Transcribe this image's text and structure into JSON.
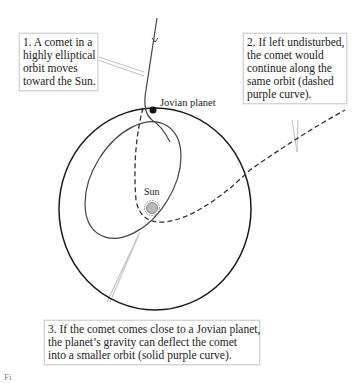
{
  "callouts": {
    "c1": {
      "lines": [
        "1. A comet in a",
        "highly elliptical",
        "orbit moves",
        "toward the Sun."
      ]
    },
    "c2": {
      "lines": [
        "2. If left undisturbed,",
        "the comet would",
        "continue along the",
        "same orbit (dashed",
        "purple curve)."
      ]
    },
    "c3": {
      "lines": [
        "3. If the comet comes close to a Jovian planet,",
        "the planet’s gravity can deflect the comet",
        "into a smaller orbit (solid purple curve)."
      ]
    }
  },
  "labels": {
    "planet": "Jovian planet",
    "sun": "Sun",
    "figure": "Fi"
  },
  "colors": {
    "orbit": "#1a1a1a",
    "comet_orbit": "#444444",
    "sun_fill": "#b8b8b8",
    "leader": "#cccccc"
  }
}
